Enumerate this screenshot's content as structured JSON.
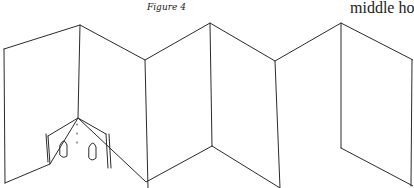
{
  "caption": "Figure 4",
  "running_text": "middle ho"
}
